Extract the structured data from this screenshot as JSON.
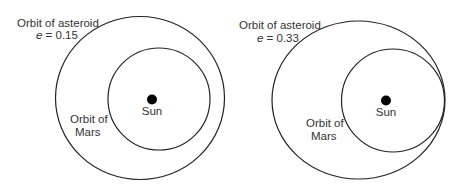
{
  "diagrams": [
    {
      "asteroid_label": "Orbit of asteroid",
      "eccentricity_symbol": "e",
      "eccentricity_value": " = 0.15",
      "mars_label_line1": "Orbit of",
      "mars_label_line2": "Mars",
      "sun_label": "Sun"
    },
    {
      "asteroid_label": "Orbit of asteroid",
      "eccentricity_symbol": "e",
      "eccentricity_value": " = 0.33",
      "mars_label_line1": "Orbit of",
      "mars_label_line2": "Mars",
      "sun_label": "Sun"
    }
  ]
}
